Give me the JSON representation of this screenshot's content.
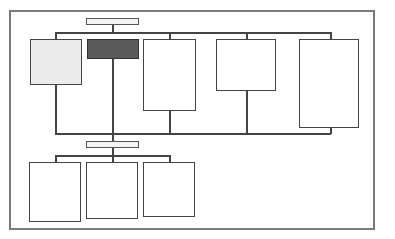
{
  "diagram": {
    "type": "org-chart-wireframe",
    "colors": {
      "frame": "#7a7a7a",
      "stroke": "#444444",
      "light_fill": "#ececec",
      "dark_fill": "#5a5a5a",
      "bar_fill": "#f4f4f4"
    },
    "top_bar": {
      "label": ""
    },
    "level1_nodes": [
      {
        "label": "",
        "fill": "light"
      },
      {
        "label": "",
        "fill": "dark"
      },
      {
        "label": "",
        "fill": "white"
      },
      {
        "label": "",
        "fill": "white"
      },
      {
        "label": "",
        "fill": "white"
      }
    ],
    "middle_bar": {
      "label": ""
    },
    "level2_nodes": [
      {
        "label": "",
        "fill": "white"
      },
      {
        "label": "",
        "fill": "white"
      },
      {
        "label": "",
        "fill": "white"
      }
    ]
  }
}
